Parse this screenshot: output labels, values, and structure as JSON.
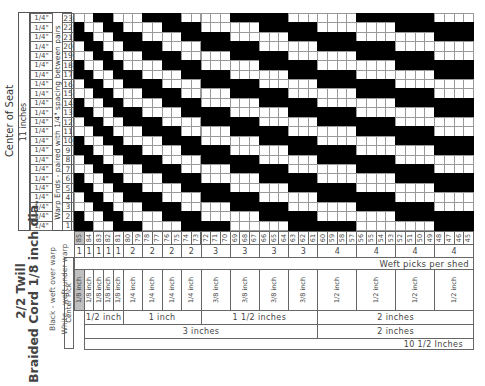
{
  "title": {
    "line1": "2/2 Twill",
    "line2": "Braided Cord 1/8 inch dia."
  },
  "legend": {
    "black": "Black - weft over warp",
    "white": "White - weft under warp"
  },
  "left_labels": {
    "center_of_seat": "Center of Seat",
    "width": "11 inches",
    "warp_note": "Warp Ends - paired with 1/4\" spacing between pairs"
  },
  "warp_rows": [
    {
      "num": "23",
      "spacing": "1/4\""
    },
    {
      "num": "22",
      "spacing": "1/4\""
    },
    {
      "num": "21",
      "spacing": "1/4\""
    },
    {
      "num": "20",
      "spacing": "1/4\""
    },
    {
      "num": "19",
      "spacing": "1/4\""
    },
    {
      "num": "18",
      "spacing": "1/4\""
    },
    {
      "num": "17",
      "spacing": "1/4\""
    },
    {
      "num": "16",
      "spacing": "1/4\""
    },
    {
      "num": "15",
      "spacing": "1/4\""
    },
    {
      "num": "14",
      "spacing": "1/4\""
    },
    {
      "num": "13",
      "spacing": "1/4\""
    },
    {
      "num": "12",
      "spacing": "1/4\""
    },
    {
      "num": "11",
      "spacing": "1/4\""
    },
    {
      "num": "10",
      "spacing": "1/4\""
    },
    {
      "num": "9",
      "spacing": "1/4\""
    },
    {
      "num": "8",
      "spacing": "1/4\""
    },
    {
      "num": "7",
      "spacing": "1/4\""
    },
    {
      "num": "6",
      "spacing": "1/4\""
    },
    {
      "num": "5",
      "spacing": "1/4\""
    },
    {
      "num": "4",
      "spacing": "1/4\""
    },
    {
      "num": "3",
      "spacing": "1/4\""
    },
    {
      "num": "2",
      "spacing": "1/4\""
    },
    {
      "num": "1",
      "spacing": "1/4\""
    }
  ],
  "weft_columns": [
    "85",
    "84",
    "83",
    "82",
    "81",
    "80",
    "79",
    "78",
    "77",
    "76",
    "75",
    "74",
    "73",
    "72",
    "71",
    "70",
    "69",
    "68",
    "67",
    "66",
    "65",
    "64",
    "63",
    "62",
    "61",
    "60",
    "59",
    "58",
    "57",
    "56",
    "55",
    "54",
    "53",
    "52",
    "51",
    "50",
    "49",
    "48",
    "47",
    "46",
    "45"
  ],
  "sheds": [
    {
      "picks": "1",
      "span": 1,
      "width": "1/8 inch"
    },
    {
      "picks": "1",
      "span": 1,
      "width": "1/8 inch"
    },
    {
      "picks": "1",
      "span": 1,
      "width": "1/8 inch"
    },
    {
      "picks": "1",
      "span": 1,
      "width": "1/8 inch"
    },
    {
      "picks": "1",
      "span": 1,
      "width": "1/8 inch"
    },
    {
      "picks": "2",
      "span": 2,
      "width": "1/4 inch"
    },
    {
      "picks": "2",
      "span": 2,
      "width": "1/4 inch"
    },
    {
      "picks": "2",
      "span": 2,
      "width": "1/4 inch"
    },
    {
      "picks": "2",
      "span": 2,
      "width": "1/4 inch"
    },
    {
      "picks": "3",
      "span": 3,
      "width": "3/8 inch"
    },
    {
      "picks": "3",
      "span": 3,
      "width": "3/8 inch"
    },
    {
      "picks": "3",
      "span": 3,
      "width": "3/8 inch"
    },
    {
      "picks": "3",
      "span": 3,
      "width": "3/8 inch"
    },
    {
      "picks": "4",
      "span": 4,
      "width": "1/2 inch"
    },
    {
      "picks": "4",
      "span": 4,
      "width": "1/2 inch"
    },
    {
      "picks": "4",
      "span": 4,
      "width": "1/2 inch"
    },
    {
      "picks": "4",
      "span": 4,
      "width": "1/2 inch"
    }
  ],
  "weft_picks_label": "Weft picks per shed",
  "center_pick_label": "Center Pick",
  "group_row1": [
    {
      "label": "1/2 inch",
      "span": 4
    },
    {
      "label": "1 inch",
      "span": 8
    },
    {
      "label": "1 1/2 inches",
      "span": 12
    },
    {
      "label": "2 inches",
      "span": 16
    }
  ],
  "group_row2": [
    {
      "label": "3 inches",
      "span": 24
    },
    {
      "label": "2 inches",
      "span": 16
    }
  ],
  "group_row3": [
    {
      "label": "10 1/2 Inches",
      "span": 41
    }
  ],
  "pattern_rule": "black if (shed_index + warp_row - 1) mod 4 in {0,1}",
  "colors": {
    "over": "#000000",
    "under": "#ffffff",
    "grid": "#999999",
    "center_pick_shade": "#bfbfbf"
  }
}
